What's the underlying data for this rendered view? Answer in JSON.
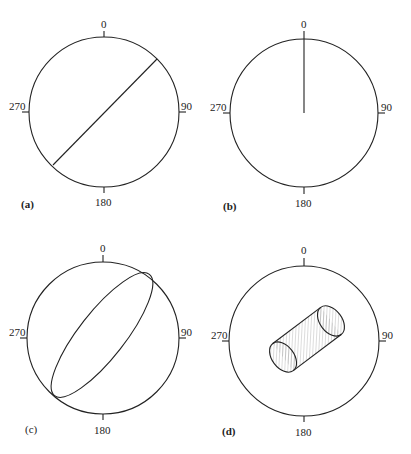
{
  "figure": {
    "panels": [
      {
        "id": "a",
        "label": "(a)",
        "ticks": {
          "top": "0",
          "right": "90",
          "bottom": "180",
          "left": "270"
        },
        "content": "diagonal-line"
      },
      {
        "id": "b",
        "label": "(b)",
        "ticks": {
          "top": "0",
          "right": "90",
          "bottom": "180",
          "left": "270"
        },
        "content": "vertical-radius-line"
      },
      {
        "id": "c",
        "label": "(c)",
        "ticks": {
          "top": "0",
          "right": "90",
          "bottom": "180",
          "left": "270"
        },
        "content": "inclined-ellipse"
      },
      {
        "id": "d",
        "label": "(d)",
        "ticks": {
          "top": "0",
          "right": "90",
          "bottom": "180",
          "left": "270"
        },
        "content": "hatched-cylinder"
      }
    ]
  },
  "colors": {
    "stroke": "#222222",
    "background": "#ffffff"
  }
}
